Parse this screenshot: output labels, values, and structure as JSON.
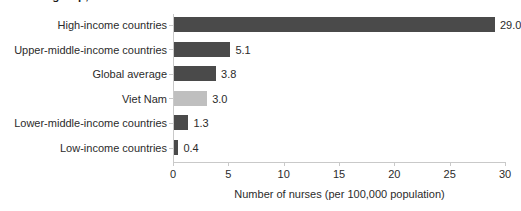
{
  "chart_data": {
    "type": "bar",
    "orientation": "horizontal",
    "title": "income group, 2021",
    "categories": [
      "High-income countries",
      "Upper-middle-income countries",
      "Global average",
      "Viet Nam",
      "Lower-middle-income countries",
      "Low-income countries"
    ],
    "values": [
      29.0,
      5.1,
      3.8,
      3.0,
      1.3,
      0.4
    ],
    "data_labels": [
      "29.0",
      "5.1",
      "3.8",
      "3.0",
      "1.3",
      "0.4"
    ],
    "bar_colors": [
      "#4a4a4a",
      "#4a4a4a",
      "#4a4a4a",
      "#bfbfbf",
      "#4a4a4a",
      "#4a4a4a"
    ],
    "highlight_category": "Viet Nam",
    "highlight_color": "#bfbfbf",
    "default_bar_color": "#4a4a4a",
    "xlabel": "Number of nurses (per 100,000 population)",
    "ylabel": "",
    "xlim": [
      0,
      30
    ],
    "xticks": [
      0,
      5,
      10,
      15,
      20,
      25,
      30
    ],
    "xtick_labels": [
      "0",
      "5",
      "10",
      "15",
      "20",
      "25",
      "30"
    ],
    "grid": false,
    "legend": null,
    "axis_color": "#c9c9c9",
    "text_color": "#2b2b2b"
  }
}
